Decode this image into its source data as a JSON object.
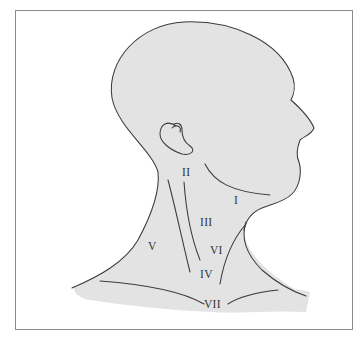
{
  "diagram": {
    "colors": {
      "skin_fill": "#e3e3e3",
      "outline": "#3a3a3a",
      "frame": "#8a8a8a",
      "background": "#ffffff"
    },
    "levels": [
      {
        "id": "I",
        "label": "I"
      },
      {
        "id": "II",
        "label": "II"
      },
      {
        "id": "III",
        "label": "III"
      },
      {
        "id": "IV",
        "label": "IV"
      },
      {
        "id": "V",
        "label": "V"
      },
      {
        "id": "VI",
        "label": "VI"
      },
      {
        "id": "VII",
        "label": "VII"
      }
    ]
  }
}
